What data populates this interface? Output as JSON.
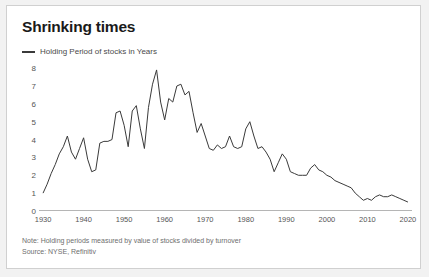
{
  "card": {
    "title": "Shrinking times",
    "legend": {
      "label": "Holding Period of stocks in Years",
      "color": "#3a3a3a"
    },
    "note": "Note: Holding periods measured by value of stocks divided by turnover",
    "source": "Source: NYSE, Refinitiv"
  },
  "chart_data": {
    "type": "line",
    "title": "Shrinking times",
    "xlabel": "",
    "ylabel": "",
    "xlim": [
      1929,
      2021
    ],
    "ylim": [
      0,
      8.4
    ],
    "grid": false,
    "legend_position": "top-left",
    "yticks": [
      0,
      1,
      2,
      3,
      4,
      5,
      6,
      7,
      8
    ],
    "xticks": [
      1930,
      1940,
      1950,
      1960,
      1970,
      1980,
      1990,
      2000,
      2010,
      2020
    ],
    "series": [
      {
        "name": "Holding Period of stocks in Years",
        "color": "#3a3a3a",
        "x": [
          1930,
          1931,
          1932,
          1933,
          1934,
          1935,
          1936,
          1937,
          1938,
          1939,
          1940,
          1941,
          1942,
          1943,
          1944,
          1945,
          1946,
          1947,
          1948,
          1949,
          1950,
          1951,
          1952,
          1953,
          1954,
          1955,
          1956,
          1957,
          1958,
          1959,
          1960,
          1961,
          1962,
          1963,
          1964,
          1965,
          1966,
          1967,
          1968,
          1969,
          1970,
          1971,
          1972,
          1973,
          1974,
          1975,
          1976,
          1977,
          1978,
          1979,
          1980,
          1981,
          1982,
          1983,
          1984,
          1985,
          1986,
          1987,
          1988,
          1989,
          1990,
          1991,
          1992,
          1993,
          1994,
          1995,
          1996,
          1997,
          1998,
          1999,
          2000,
          2001,
          2002,
          2003,
          2004,
          2005,
          2006,
          2007,
          2008,
          2009,
          2010,
          2011,
          2012,
          2013,
          2014,
          2015,
          2016,
          2017,
          2018,
          2019,
          2020
        ],
        "values": [
          1.0,
          1.5,
          2.1,
          2.6,
          3.2,
          3.6,
          4.2,
          3.3,
          2.9,
          3.5,
          4.1,
          2.9,
          2.2,
          2.3,
          3.8,
          3.9,
          3.9,
          4.0,
          5.5,
          5.6,
          4.8,
          3.6,
          5.6,
          5.9,
          4.6,
          3.5,
          5.8,
          7.1,
          7.9,
          6.1,
          5.1,
          6.3,
          6.1,
          7.0,
          7.1,
          6.5,
          6.7,
          5.5,
          4.4,
          4.9,
          4.2,
          3.5,
          3.4,
          3.7,
          3.5,
          3.6,
          4.2,
          3.6,
          3.5,
          3.6,
          4.6,
          5.0,
          4.2,
          3.5,
          3.6,
          3.3,
          2.9,
          2.2,
          2.7,
          3.2,
          2.9,
          2.2,
          2.1,
          2.0,
          2.0,
          2.0,
          2.4,
          2.6,
          2.3,
          2.2,
          2.0,
          1.9,
          1.7,
          1.6,
          1.5,
          1.4,
          1.3,
          1.0,
          0.8,
          0.6,
          0.7,
          0.6,
          0.8,
          0.9,
          0.8,
          0.8,
          0.9,
          0.8,
          0.7,
          0.6,
          0.5
        ]
      }
    ]
  }
}
